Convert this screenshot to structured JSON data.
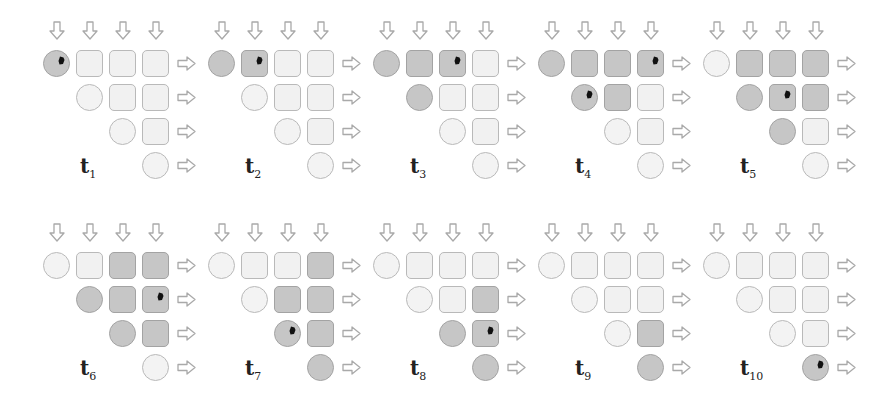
{
  "diagram": {
    "colors": {
      "inactive_fill": "#f1f1f1",
      "active_fill": "#c6c6c6",
      "border": "#b9b9b9",
      "marker": "#111111"
    },
    "grid_size": 4,
    "panels": [
      {
        "label": "t",
        "sub": "1",
        "active": [
          [
            0,
            0
          ]
        ],
        "marker": [
          [
            0,
            0
          ]
        ]
      },
      {
        "label": "t",
        "sub": "2",
        "active": [
          [
            0,
            0
          ],
          [
            0,
            1
          ]
        ],
        "marker": [
          [
            0,
            1
          ]
        ]
      },
      {
        "label": "t",
        "sub": "3",
        "active": [
          [
            0,
            0
          ],
          [
            0,
            1
          ],
          [
            0,
            2
          ],
          [
            1,
            1
          ]
        ],
        "marker": [
          [
            0,
            2
          ]
        ]
      },
      {
        "label": "t",
        "sub": "4",
        "active": [
          [
            0,
            0
          ],
          [
            0,
            1
          ],
          [
            0,
            2
          ],
          [
            0,
            3
          ],
          [
            1,
            1
          ],
          [
            1,
            2
          ]
        ],
        "marker": [
          [
            0,
            3
          ],
          [
            1,
            1
          ]
        ]
      },
      {
        "label": "t",
        "sub": "5",
        "active": [
          [
            0,
            1
          ],
          [
            0,
            2
          ],
          [
            0,
            3
          ],
          [
            1,
            1
          ],
          [
            1,
            2
          ],
          [
            1,
            3
          ],
          [
            2,
            2
          ]
        ],
        "marker": [
          [
            1,
            2
          ]
        ]
      },
      {
        "label": "t",
        "sub": "6",
        "active": [
          [
            0,
            2
          ],
          [
            0,
            3
          ],
          [
            1,
            1
          ],
          [
            1,
            2
          ],
          [
            1,
            3
          ],
          [
            2,
            2
          ],
          [
            2,
            3
          ]
        ],
        "marker": [
          [
            1,
            3
          ]
        ]
      },
      {
        "label": "t",
        "sub": "7",
        "active": [
          [
            0,
            3
          ],
          [
            1,
            2
          ],
          [
            1,
            3
          ],
          [
            2,
            2
          ],
          [
            2,
            3
          ],
          [
            3,
            3
          ]
        ],
        "marker": [
          [
            2,
            2
          ]
        ]
      },
      {
        "label": "t",
        "sub": "8",
        "active": [
          [
            1,
            3
          ],
          [
            2,
            2
          ],
          [
            2,
            3
          ],
          [
            3,
            3
          ]
        ],
        "marker": [
          [
            2,
            3
          ]
        ]
      },
      {
        "label": "t",
        "sub": "9",
        "active": [
          [
            2,
            3
          ],
          [
            3,
            3
          ]
        ],
        "marker": []
      },
      {
        "label": "t",
        "sub": "10",
        "active": [
          [
            3,
            3
          ]
        ],
        "marker": [
          [
            3,
            3
          ]
        ]
      }
    ]
  }
}
